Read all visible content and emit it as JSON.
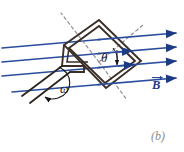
{
  "figure": {
    "panel_label": "(b)",
    "background_color": "#ffffff",
    "width": 184,
    "height": 152
  },
  "labels": {
    "angle": "θ",
    "angular_velocity": "ω",
    "field_vector": "B"
  },
  "colors": {
    "field_line": "#2b4d9e",
    "field_line_dark": "#1d3a84",
    "coil_wire": "#3b2f28",
    "normal_dashed": "#8a8a8a",
    "panel_label": "#8c8c8c",
    "text": "#15161a"
  },
  "field_lines": [
    {
      "name": "field-line-1",
      "x1": 2,
      "y1": 48,
      "x2": 176,
      "y2": 33
    },
    {
      "name": "field-line-2",
      "x1": 2,
      "y1": 62,
      "x2": 176,
      "y2": 47
    },
    {
      "name": "field-line-3",
      "x1": 2,
      "y1": 76,
      "x2": 176,
      "y2": 61
    },
    {
      "name": "field-line-4",
      "x1": 12,
      "y1": 92,
      "x2": 176,
      "y2": 78
    }
  ],
  "coil": {
    "outer_path": "M 63,45 L 99,20 L 140,62 L 104,88 Z",
    "inner_path": "M 67,47 L 99,25 L 135,62 L 103,84 Z",
    "turns": 2
  },
  "leads": {
    "lead_a": {
      "x1": 62,
      "y1": 66,
      "x2": 22,
      "y2": 96
    },
    "lead_b": {
      "x1": 70,
      "y1": 72,
      "x2": 30,
      "y2": 102
    }
  },
  "normal_axis": {
    "upper_left": {
      "x1": 99,
      "y1": 62,
      "x2": 62,
      "y2": 14
    },
    "upper_right": {
      "x1": 99,
      "y1": 62,
      "x2": 142,
      "y2": 26
    },
    "lower_right": {
      "x1": 99,
      "y1": 62,
      "x2": 126,
      "y2": 99
    }
  },
  "rotation_arc": {
    "path": "M 58,70 A 16 22 0 1 0 48,98",
    "arrow_at": {
      "x": 48,
      "y": 98
    }
  }
}
